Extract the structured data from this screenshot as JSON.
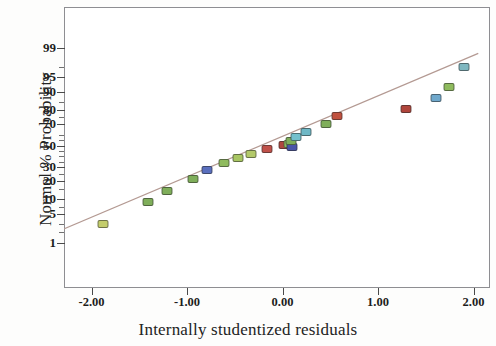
{
  "axes": {
    "x_title": "Internally studentized residuals",
    "y_title": "Normal % Probability"
  },
  "chart_data": {
    "type": "scatter",
    "title": "",
    "subtitle": "",
    "xlabel": "Internally studentized residuals",
    "ylabel": "Normal % Probability",
    "xlim": [
      -2.55,
      2.18
    ],
    "ylim_percent": [
      0.4,
      99.8
    ],
    "y_scale": "normal-probability",
    "grid": false,
    "legend": null,
    "legend_position": "none",
    "x_ticks": [
      "-2.00",
      "-1.00",
      "0.00",
      "1.00",
      "2.00"
    ],
    "x_tick_values": [
      -2.0,
      -1.0,
      0.0,
      1.0,
      2.0
    ],
    "y_ticks": [
      "99",
      "95",
      "90",
      "80",
      "70",
      "50",
      "30",
      "20",
      "10",
      "5",
      "1"
    ],
    "y_tick_values": [
      99,
      95,
      90,
      80,
      70,
      50,
      30,
      20,
      10,
      5,
      1
    ],
    "y_minor_ticks": [
      97,
      85,
      75,
      60,
      55,
      45,
      40,
      35,
      25,
      15,
      7,
      3,
      2
    ],
    "reference_line": {
      "label": "normal reference line",
      "color": "#b49a93",
      "x_start": -2.45,
      "y_start_percent": 1.6,
      "x_end": 2.05,
      "y_end_percent": 98.6
    },
    "series": [
      {
        "name": "residual points",
        "marker": "rounded-rectangle",
        "points": [
          {
            "x": -1.88,
            "y_percent": 3.0,
            "color": "#c3cc6b"
          },
          {
            "x": -1.41,
            "y_percent": 9.0,
            "color": "#7fae5a"
          },
          {
            "x": -1.21,
            "y_percent": 14.0,
            "color": "#7fae5a"
          },
          {
            "x": -0.94,
            "y_percent": 21.0,
            "color": "#7fae5a"
          },
          {
            "x": -0.79,
            "y_percent": 28.0,
            "color": "#5a6fbe"
          },
          {
            "x": -0.61,
            "y_percent": 34.0,
            "color": "#8fbb5e"
          },
          {
            "x": -0.47,
            "y_percent": 38.0,
            "color": "#a8c663"
          },
          {
            "x": -0.33,
            "y_percent": 42.0,
            "color": "#b3c96a"
          },
          {
            "x": -0.16,
            "y_percent": 47.0,
            "color": "#c0514a"
          },
          {
            "x": 0.02,
            "y_percent": 50.5,
            "color": "#b0473f"
          },
          {
            "x": 0.07,
            "y_percent": 51.5,
            "color": "#8fbb5e"
          },
          {
            "x": 0.1,
            "y_percent": 49.0,
            "color": "#4a55a8"
          },
          {
            "x": 0.09,
            "y_percent": 54.0,
            "color": "#7fae5a"
          },
          {
            "x": 0.14,
            "y_percent": 58.0,
            "color": "#73c0cd"
          },
          {
            "x": 0.25,
            "y_percent": 63.0,
            "color": "#6fb8c6"
          },
          {
            "x": 0.46,
            "y_percent": 70.0,
            "color": "#7fae5a"
          },
          {
            "x": 0.57,
            "y_percent": 76.0,
            "color": "#c0513f"
          },
          {
            "x": 1.29,
            "y_percent": 81.0,
            "color": "#b0453c"
          },
          {
            "x": 1.61,
            "y_percent": 87.0,
            "color": "#6fa8cc"
          },
          {
            "x": 1.74,
            "y_percent": 92.0,
            "color": "#8fbb5e"
          },
          {
            "x": 1.9,
            "y_percent": 97.0,
            "color": "#7fb7c0"
          }
        ]
      }
    ]
  }
}
